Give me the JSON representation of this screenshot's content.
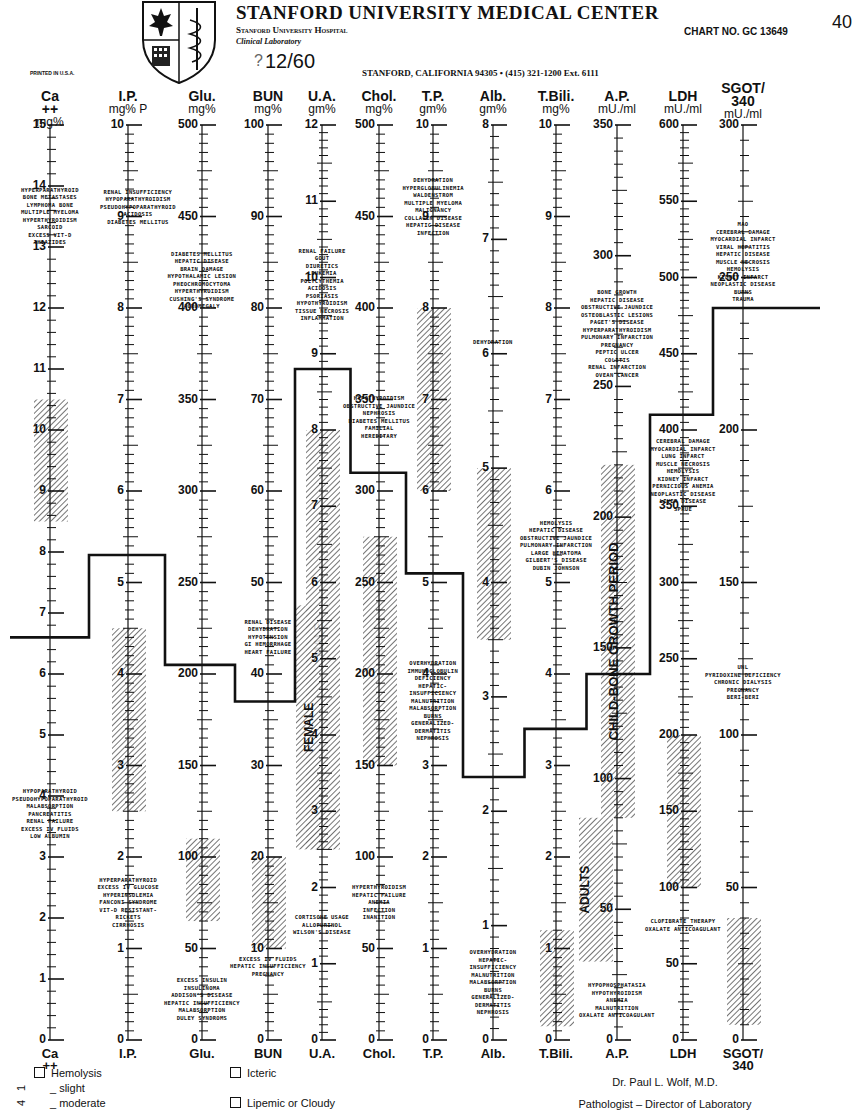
{
  "header": {
    "title": "STANFORD UNIVERSITY MEDICAL CENTER",
    "hospital": "Stanford University Hospital",
    "lab": "Clinical Laboratory",
    "chart_no": "CHART NO. GC 13649",
    "page_mark": "40",
    "printed": "PRINTED IN U.S.A.",
    "date": "12/60",
    "date_prefix": "?",
    "address": "STANFORD, CALIFORNIA 94305 • (415) 321-1200 Ext. 6111"
  },
  "footer": {
    "legend": {
      "hemolysis": "Hemolysis",
      "slight": "_ slight",
      "moderate": "_ moderate",
      "icteric": "Icteric",
      "lipemic": "Lipemic or Cloudy",
      "margin_marks": [
        "1",
        "4"
      ]
    },
    "signature": {
      "name": "Dr. Paul L. Wolf, M.D.",
      "role": "Pathologist – Director of Laboratory"
    }
  },
  "chart_data": {
    "type": "line",
    "layout": {
      "top_y": 125,
      "bottom_y": 1040,
      "grid": false,
      "legend_position": "bottom-left"
    },
    "axes": [
      {
        "id": "ca",
        "label": "Ca ++",
        "footer": "Ca ++",
        "unit": "mg%",
        "x": 50,
        "max": 15,
        "major": 1,
        "minor": 5,
        "labels": [
          0,
          1,
          2,
          3,
          4,
          5,
          6,
          7,
          8,
          9,
          10,
          11,
          12,
          13,
          14,
          15
        ]
      },
      {
        "id": "ip",
        "label": "I.P.",
        "footer": "I.P.",
        "unit": "mg% P",
        "x": 128,
        "max": 10,
        "major": 1,
        "minor": 10,
        "labels": [
          0,
          1,
          2,
          3,
          4,
          5,
          6,
          7,
          8,
          9,
          10
        ]
      },
      {
        "id": "glu",
        "label": "Glu.",
        "footer": "Glu.",
        "unit": "mg%",
        "x": 202,
        "max": 500,
        "major": 50,
        "minor": 10,
        "labels": [
          0,
          50,
          100,
          150,
          200,
          250,
          300,
          350,
          400,
          450,
          500
        ]
      },
      {
        "id": "bun",
        "label": "BUN",
        "footer": "BUN",
        "unit": "mg%",
        "x": 268,
        "max": 100,
        "major": 10,
        "minor": 10,
        "labels": [
          0,
          10,
          20,
          30,
          40,
          50,
          60,
          70,
          80,
          90,
          100
        ]
      },
      {
        "id": "ua",
        "label": "U.A.",
        "footer": "U.A.",
        "unit": "gm%",
        "x": 322,
        "max": 12,
        "major": 1,
        "minor": 10,
        "labels": [
          0,
          1,
          2,
          3,
          4,
          5,
          6,
          7,
          8,
          9,
          10,
          11,
          12
        ]
      },
      {
        "id": "chol",
        "label": "Chol.",
        "footer": "Chol.",
        "unit": "mg%",
        "x": 379,
        "max": 500,
        "major": 50,
        "minor": 10,
        "labels": [
          0,
          50,
          100,
          150,
          200,
          250,
          300,
          350,
          400,
          450,
          500
        ]
      },
      {
        "id": "tp",
        "label": "T.P.",
        "footer": "T.P.",
        "unit": "gm%",
        "x": 433,
        "max": 10,
        "major": 1,
        "minor": 10,
        "labels": [
          0,
          1,
          2,
          3,
          4,
          5,
          6,
          7,
          8,
          9,
          10
        ]
      },
      {
        "id": "alb",
        "label": "Alb.",
        "footer": "Alb.",
        "unit": "gm%",
        "x": 493,
        "max": 8,
        "major": 1,
        "minor": 10,
        "labels": [
          0,
          1,
          2,
          3,
          4,
          5,
          6,
          7,
          8
        ]
      },
      {
        "id": "tbili",
        "label": "T.Bili.",
        "footer": "T.Bili.",
        "unit": "mg%",
        "x": 556,
        "max": 10,
        "major": 1,
        "minor": 10,
        "labels": [
          0,
          1,
          2,
          3,
          4,
          5,
          6,
          7,
          8,
          9,
          10
        ]
      },
      {
        "id": "ap",
        "label": "A.P.",
        "footer": "A.P.",
        "unit": "mU./ml",
        "x": 617,
        "max": 350,
        "major": 50,
        "minor": 10,
        "labels": [
          0,
          50,
          100,
          150,
          200,
          250,
          300,
          350
        ]
      },
      {
        "id": "ldh",
        "label": "LDH",
        "footer": "LDH",
        "unit": "mU./ml",
        "x": 683,
        "max": 600,
        "major": 50,
        "minor": 10,
        "labels": [
          0,
          50,
          100,
          150,
          200,
          250,
          300,
          350,
          400,
          450,
          500,
          550,
          600
        ]
      },
      {
        "id": "sgot",
        "label": "SGOT/ 340",
        "footer": "SGOT/ 340",
        "unit": "mU./ml",
        "x": 743,
        "max": 300,
        "major": 50,
        "minor": 10,
        "labels": [
          0,
          50,
          100,
          150,
          200,
          250,
          300
        ]
      }
    ],
    "normal_ranges": [
      {
        "axis": "ca",
        "low": 8.5,
        "high": 10.5,
        "label": ""
      },
      {
        "axis": "ip",
        "low": 2.5,
        "high": 4.5,
        "label": ""
      },
      {
        "axis": "glu",
        "low": 65,
        "high": 110,
        "label": ""
      },
      {
        "axis": "bun",
        "low": 10,
        "high": 20,
        "label": ""
      },
      {
        "axis": "ua",
        "low": 2.5,
        "high": 8.0,
        "label": "MALE"
      },
      {
        "axis": "ua",
        "low": 2.5,
        "high": 5.7,
        "label": "FEMALE",
        "offset": -10
      },
      {
        "axis": "chol",
        "low": 150,
        "high": 275,
        "label": ""
      },
      {
        "axis": "tp",
        "low": 6.0,
        "high": 8.0,
        "label": ""
      },
      {
        "axis": "alb",
        "low": 3.5,
        "high": 5.0,
        "label": ""
      },
      {
        "axis": "tbili",
        "low": 0.15,
        "high": 1.2,
        "label": ""
      },
      {
        "axis": "ap",
        "low": 30,
        "high": 85,
        "label": "ADULTS",
        "side": -1
      },
      {
        "axis": "ap",
        "low": 85,
        "high": 220,
        "label": "CHILD-BONE GROWTH PERIOD"
      },
      {
        "axis": "ldh",
        "low": 100,
        "high": 200,
        "label": ""
      },
      {
        "axis": "sgot",
        "low": 5,
        "high": 40,
        "label": ""
      }
    ],
    "patient_values": [
      {
        "axis": "ca",
        "value": 6.6
      },
      {
        "axis": "ip",
        "value": 5.3
      },
      {
        "axis": "glu",
        "value": 205
      },
      {
        "axis": "bun",
        "value": 37
      },
      {
        "axis": "ua",
        "value": 8.8
      },
      {
        "axis": "chol",
        "value": 310
      },
      {
        "axis": "tp",
        "value": 5.1
      },
      {
        "axis": "alb",
        "value": 2.3
      },
      {
        "axis": "tbili",
        "value": 3.4
      },
      {
        "axis": "ap",
        "value": 140
      },
      {
        "axis": "ldh",
        "value": 410
      },
      {
        "axis": "sgot",
        "value": 240
      }
    ],
    "annotations": [
      {
        "axis": "ca",
        "value": 13.5,
        "text": "HYPERPARATHYROID\nBONE METASTASES\nLYMPHOMA BONE\nMULTIPLE MYELOMA\nHYPERTHYROIDISM\nSARCOID\nEXCESS VIT-D\nTHIAZIDES"
      },
      {
        "axis": "ca",
        "value": 3.7,
        "dx": 0,
        "text": "HYPOPARATHYROID\nPSEUDOHYPOPARATHYROID\nMALABSORPTION\nPANCREATITIS\nRENAL FAILURE\nEXCESS IV FLUIDS\nLOW ALBUMIN"
      },
      {
        "axis": "ip",
        "value": 9.1,
        "dx": 10,
        "text": "RENAL INSUFFICIENCY\nHYPOPARATHYROIDISM\nPSEUDOHYPOPARATHYROID\nACIDOSIS\nDIABETES MELLITUS"
      },
      {
        "axis": "ip",
        "value": 1.5,
        "text": "HYPERPARATHYROID\nEXCESS IV GLUCOSE\nHYPERINSULEMIA\nFANCONI SYNDROME\nVIT-D RESISTANT-\nRICKETS\nCIRRHOSIS"
      },
      {
        "axis": "glu",
        "value": 415,
        "text": "DIABETES MELLITUS\nHEPATIC DISEASE\nBRAIN DAMAGE\nHYPOTHALAMIC LESION\nPHEOCHROMOCYTOMA\nHYPERTHYROIDISM\nCUSHING'S SYNDROME\nACROMEGALY"
      },
      {
        "axis": "glu",
        "value": 22,
        "text": "EXCESS INSULIN\nINSULINOMA\nADDISON'S DISEASE\nHEPATIC INSUFFICIENCY\nMALABSORPTION\nDULEY SYNDROMS"
      },
      {
        "axis": "bun",
        "value": 44,
        "text": "RENAL DISEASE\nDEHYDRATION\nHYPOTENSION\nGI HEMORRHAGE\nHEART FAILURE"
      },
      {
        "axis": "bun",
        "value": 8,
        "text": "EXCESS IV FLUIDS\nHEPATIC INSUFFICIENCY\nPREGNANCY"
      },
      {
        "axis": "ua",
        "value": 9.9,
        "text": "RENAL FAILURE\nGOUT\nDIURETICS\nLEUKEMIA\nPOLYCYTHEMIA\nACIDOSIS\nPSORIASIS\nHYPOTHYROIDISM\nTISSUE NECROSIS\nINFLAMMATION"
      },
      {
        "axis": "ua",
        "value": 1.5,
        "text": "CORTISONE USAGE\nALLOPURINOL\nWILSON'S DISEASE"
      },
      {
        "axis": "chol",
        "value": 340,
        "text": "HYPOTHYROIDISM\nOBSTRUCTIVE JAUNDICE\nNEPHROSIS\nDIABETES MELLITUS\nFAMILIAL\nHEREDITARY"
      },
      {
        "axis": "chol",
        "value": 75,
        "text": "HYPERTHYROIDISM\nHEPATIC FAILURE\nANEMIA\nINFECTION\nINANITION"
      },
      {
        "axis": "tp",
        "value": 9.1,
        "text": "DEHYDRATION\nHYPERGLOBULINEMIA\nWALDENSTROM\nMULTIPLE MYELOMA\nMALIGNANCY\nCOLLAGEN DISEASE\nHEPATIC DISEASE\nINFECTION"
      },
      {
        "axis": "tp",
        "value": 3.7,
        "text": "OVERHYDRATION\nIMMUNOGLOBULIN\nDEFICIENCY\nHEPATIC-\nINSUFFICIENCY\nMALNUTRITION\nMALABSORPTION\nBURNS\nGENERALIZED-\nDERMATITIS\nNEPHROSIS"
      },
      {
        "axis": "alb",
        "value": 6.1,
        "text": "DEHYDRATION"
      },
      {
        "axis": "alb",
        "value": 0.5,
        "text": "OVERHYDRATION\nHEPATIC-\nINSUFFICIENCY\nMALNUTRITION\nMALABSORPTION\nBURNS\nGENERALIZED-\nDERMATITIS\nNEPHROSIS"
      },
      {
        "axis": "tbili",
        "value": 5.4,
        "text": "HEMOLYSIS\nHEPATIC DISEASE\nOBSTRUCTIVE JAUNDICE\nPULMONARY INFARCTION\nLARGE HEMATOMA\nGILBERT'S DISEASE\nDUBIN JOHNSON"
      },
      {
        "axis": "ap",
        "value": 270,
        "text": "BONE GROWTH\nHEPATIC DISEASE\nOBSTRUCTIVE JAUNDICE\nOSTEOBLASTIC LESIONS\nPAGET'S DISEASE\nHYPERPARATHYROIDISM\nPULMONARY INFARCTION\nPREGNANCY\nPEPTIC ULCER\nCOLITIS\nRENAL INFARCTION\nOVEAN CANCER"
      },
      {
        "axis": "ap",
        "value": 15,
        "text": "HYPOPHOSPHATASIA\nHYPOTHYROIDISM\nANEMIA\nMALNUTRITION\nOXALATE ANTICOAGULANT"
      },
      {
        "axis": "ldh",
        "value": 370,
        "text": "CEREBRAL DAMAGE\nMYOCARDIAL INFARCT\nLUNG INFARCT\nMUSCLE NECROSIS\nHEMOLYSIS\nKIDNEY INFARCT\nPERNICIOUS ANEMIA\nNEOPLASTIC DISEASE\nLIVER DISEASE\nSPRUE"
      },
      {
        "axis": "ldh",
        "value": 75,
        "text": "CLOFIBRATE THERAPY\nOXALATE ANTICOAGULANT"
      },
      {
        "axis": "sgot",
        "value": 255,
        "text": "MAO\nCEREBRAL DAMAGE\nMYOCARDIAL INFARCT\nVIRAL HEPATITIS\nHEPATIC DISEASE\nMUSCLE NECROSIS\nHEMOLYSIS\nKIDNEY INFARCT\nNEOPLASTIC DISEASE\nBURNS\nTRAUMA"
      },
      {
        "axis": "sgot",
        "value": 117,
        "text": "UNL\nPYRIDOXINE DEFICIENCY\nCHRONIC DIALYSIS\nPREGNANCY\nBERI-BERI"
      }
    ]
  }
}
